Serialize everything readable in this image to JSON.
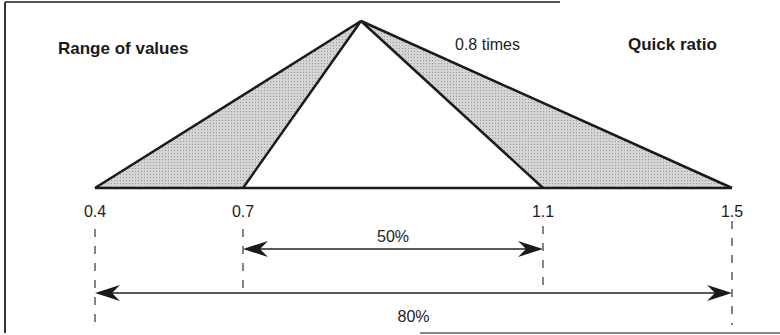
{
  "title_left": "Range of values",
  "title_right": "Quick ratio",
  "center_annotation": "0.8 times",
  "scale": {
    "min": 0.4,
    "max": 1.5,
    "apex_value": 0.8,
    "inner_low": 0.7,
    "inner_high": 1.1,
    "tick_labels": [
      "0.4",
      "0.7",
      "1.1",
      "1.5"
    ]
  },
  "ranges": [
    {
      "name": "inner",
      "from": 0.7,
      "to": 1.1,
      "label": "50%"
    },
    {
      "name": "outer",
      "from": 0.4,
      "to": 1.5,
      "label": "80%"
    }
  ],
  "colors": {
    "stroke": "#1a1a1a",
    "shade": "#c8c8c8",
    "frame": "#333333"
  }
}
